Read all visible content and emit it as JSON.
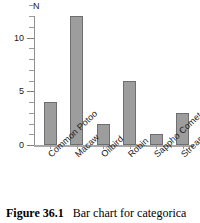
{
  "chart_data": {
    "type": "bar",
    "title": "",
    "xlabel": "",
    "ylabel": "N",
    "categories": [
      "Common Potoo",
      "Macaw",
      "Oilbird",
      "Robin",
      "Sappho Comet",
      "Streamertail"
    ],
    "values": [
      4,
      12,
      2,
      6,
      1,
      3
    ],
    "ylim": [
      0,
      13
    ],
    "yticks_major": [
      "0",
      "5",
      "10"
    ],
    "ytick_major_values": [
      0,
      5,
      10
    ],
    "ytick_minor_values": [
      1,
      2,
      3,
      4,
      6,
      7,
      8,
      9,
      11,
      12,
      13
    ],
    "grid": false,
    "legend": false,
    "bar_color": "#9d9d9d",
    "bar_edge_color": "#6f6f6f",
    "axis_color": "#9a9a9a"
  },
  "caption": {
    "figure_number": "Figure 36.1",
    "text": "Bar chart for categorica"
  }
}
